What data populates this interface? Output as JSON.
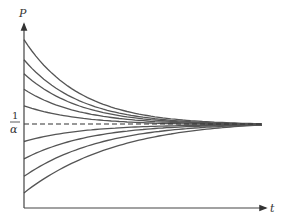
{
  "chart_data": {
    "type": "line",
    "title": "",
    "xlabel": "t",
    "ylabel": "P",
    "reference_line": {
      "label_numerator": "1",
      "label_denominator": "α",
      "style": "dashed",
      "meaning": "equilibrium 1/α"
    },
    "grid": false,
    "legend": null,
    "x_range": [
      0,
      1
    ],
    "y_range_relative_to_equilibrium": [
      -1,
      1.05
    ],
    "series": [
      {
        "name": "above-1",
        "start": 0.98,
        "end": 0.0
      },
      {
        "name": "above-2",
        "start": 0.75,
        "end": 0.0
      },
      {
        "name": "above-3",
        "start": 0.59,
        "end": 0.0
      },
      {
        "name": "above-4",
        "start": 0.41,
        "end": 0.0
      },
      {
        "name": "above-5",
        "start": 0.22,
        "end": 0.0
      },
      {
        "name": "below-1",
        "start": -0.19,
        "end": 0.0
      },
      {
        "name": "below-2",
        "start": -0.39,
        "end": 0.0
      },
      {
        "name": "below-3",
        "start": -0.59,
        "end": 0.0
      },
      {
        "name": "below-4",
        "start": -0.78,
        "end": 0.0
      }
    ]
  },
  "labels": {
    "y_axis": "P",
    "x_axis": "t",
    "eq_num": "1",
    "eq_den": "α"
  },
  "colors": {
    "curve": "#555555",
    "axis": "#444444",
    "dash": "#333333"
  }
}
